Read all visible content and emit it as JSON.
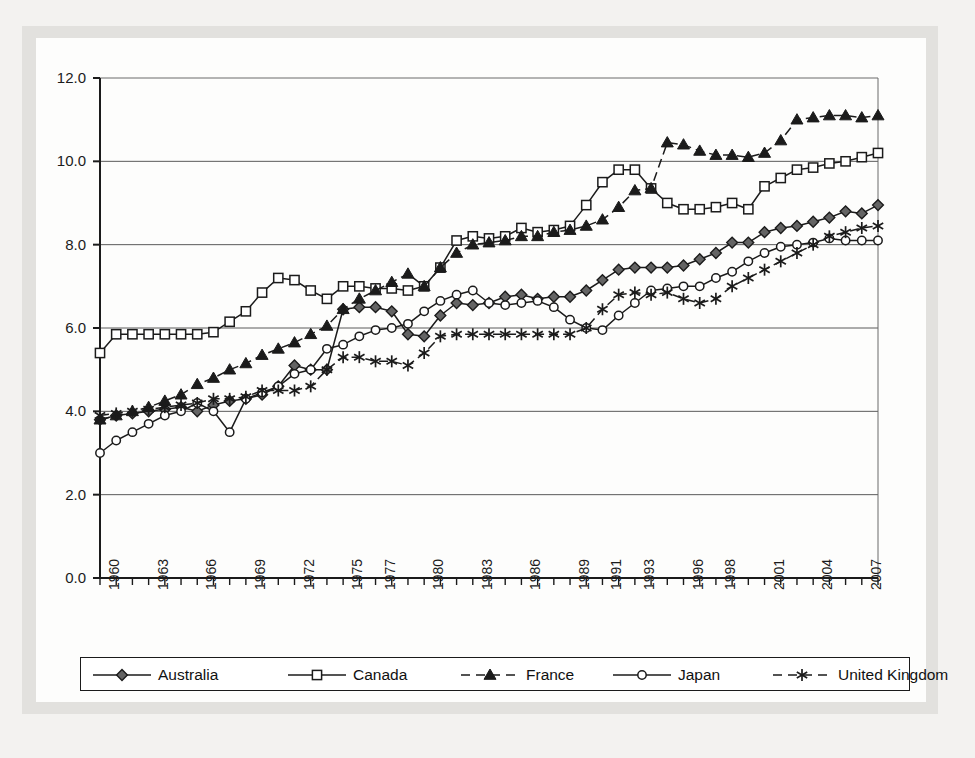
{
  "figure": {
    "background_color": "#e2e1de",
    "card_color": "#fdfdfc",
    "ink_color": "#1b1b1b"
  },
  "legend": {
    "items": [
      {
        "label": "Australia",
        "marker": "filled-diamond-marker",
        "line": "solid"
      },
      {
        "label": "Canada",
        "marker": "open-square-marker",
        "line": "solid"
      },
      {
        "label": "France",
        "marker": "filled-triangle-marker",
        "line": "dashed"
      },
      {
        "label": "Japan",
        "marker": "open-circle-marker",
        "line": "solid"
      },
      {
        "label": "United Kingdom",
        "marker": "asterisk-marker",
        "line": "dashed"
      }
    ]
  },
  "chart_data": {
    "type": "line",
    "title": "",
    "subtitle": "",
    "xlabel": "",
    "ylabel": "",
    "grid": true,
    "legend_position": "bottom",
    "ylim": [
      0.0,
      12.0
    ],
    "ytick_labels": [
      "0.0",
      "2.0",
      "4.0",
      "6.0",
      "8.0",
      "10.0",
      "12.0"
    ],
    "ytick_values": [
      0.0,
      2.0,
      4.0,
      6.0,
      8.0,
      10.0,
      12.0
    ],
    "xlim": [
      1960,
      2008
    ],
    "xtick_labels": [
      "1960",
      "1963",
      "1966",
      "1969",
      "1972",
      "1975",
      "1977",
      "1980",
      "1983",
      "1986",
      "1989",
      "1991",
      "1993",
      "1996",
      "1998",
      "2001",
      "2004",
      "2007"
    ],
    "xtick_values": [
      1960,
      1963,
      1966,
      1969,
      1972,
      1975,
      1977,
      1980,
      1983,
      1986,
      1989,
      1991,
      1993,
      1996,
      1998,
      2001,
      2004,
      2007
    ],
    "x": [
      1960,
      1961,
      1962,
      1963,
      1964,
      1965,
      1966,
      1967,
      1968,
      1969,
      1970,
      1971,
      1972,
      1973,
      1974,
      1975,
      1976,
      1977,
      1978,
      1979,
      1980,
      1981,
      1982,
      1983,
      1984,
      1985,
      1986,
      1987,
      1988,
      1989,
      1990,
      1991,
      1992,
      1993,
      1994,
      1995,
      1996,
      1997,
      1998,
      1999,
      2000,
      2001,
      2002,
      2003,
      2004,
      2005,
      2006,
      2007,
      2008
    ],
    "series": [
      {
        "name": "Australia",
        "marker": "filled-diamond-marker",
        "line": "solid",
        "values": [
          3.8,
          3.9,
          3.95,
          4.0,
          4.05,
          4.1,
          4.0,
          4.15,
          4.25,
          4.3,
          4.4,
          4.6,
          5.1,
          5.0,
          5.0,
          6.45,
          6.5,
          6.5,
          6.4,
          5.85,
          5.8,
          6.3,
          6.6,
          6.55,
          6.6,
          6.75,
          6.8,
          6.7,
          6.75,
          6.75,
          6.9,
          7.15,
          7.4,
          7.45,
          7.45,
          7.45,
          7.5,
          7.65,
          7.8,
          8.05,
          8.05,
          8.3,
          8.4,
          8.45,
          8.55,
          8.65,
          8.8,
          8.75,
          8.95
        ]
      },
      {
        "name": "Canada",
        "marker": "open-square-marker",
        "line": "solid",
        "values": [
          5.4,
          5.85,
          5.85,
          5.85,
          5.85,
          5.85,
          5.85,
          5.9,
          6.15,
          6.4,
          6.85,
          7.2,
          7.15,
          6.9,
          6.7,
          7.0,
          7.0,
          6.95,
          6.95,
          6.9,
          7.0,
          7.45,
          8.1,
          8.2,
          8.15,
          8.2,
          8.4,
          8.3,
          8.35,
          8.45,
          8.95,
          9.5,
          9.8,
          9.8,
          9.35,
          9.0,
          8.85,
          8.85,
          8.9,
          9.0,
          8.85,
          9.4,
          9.6,
          9.8,
          9.85,
          9.95,
          10.0,
          10.1,
          10.2
        ]
      },
      {
        "name": "France",
        "marker": "filled-triangle-marker",
        "line": "dashed",
        "values": [
          3.8,
          3.9,
          4.0,
          4.1,
          4.25,
          4.4,
          4.65,
          4.8,
          5.0,
          5.15,
          5.35,
          5.5,
          5.65,
          5.85,
          6.05,
          6.45,
          6.7,
          6.9,
          7.1,
          7.3,
          7.0,
          7.45,
          7.8,
          8.0,
          8.05,
          8.1,
          8.2,
          8.2,
          8.3,
          8.35,
          8.45,
          8.6,
          8.9,
          9.3,
          9.35,
          10.45,
          10.4,
          10.25,
          10.15,
          10.15,
          10.1,
          10.2,
          10.5,
          11.0,
          11.05,
          11.1,
          11.1,
          11.05,
          11.1
        ]
      },
      {
        "name": "Japan",
        "marker": "open-circle-marker",
        "line": "solid",
        "values": [
          3.0,
          3.3,
          3.5,
          3.7,
          3.9,
          4.0,
          4.2,
          4.0,
          3.5,
          4.3,
          4.45,
          4.6,
          4.9,
          5.0,
          5.5,
          5.6,
          5.8,
          5.95,
          6.0,
          6.1,
          6.4,
          6.65,
          6.8,
          6.9,
          6.6,
          6.55,
          6.6,
          6.65,
          6.5,
          6.2,
          6.0,
          5.95,
          6.3,
          6.6,
          6.9,
          6.95,
          7.0,
          7.0,
          7.2,
          7.35,
          7.6,
          7.8,
          7.95,
          8.0,
          8.05,
          8.15,
          8.1,
          8.1,
          8.1
        ]
      },
      {
        "name": "United Kingdom",
        "marker": "asterisk-marker",
        "line": "dashed",
        "values": [
          3.9,
          3.95,
          4.0,
          4.05,
          4.1,
          4.15,
          4.2,
          4.3,
          4.3,
          4.35,
          4.5,
          4.5,
          4.5,
          4.6,
          5.0,
          5.3,
          5.3,
          5.2,
          5.2,
          5.1,
          5.4,
          5.8,
          5.85,
          5.85,
          5.85,
          5.85,
          5.85,
          5.85,
          5.85,
          5.85,
          6.0,
          6.45,
          6.8,
          6.85,
          6.8,
          6.85,
          6.7,
          6.6,
          6.7,
          7.0,
          7.2,
          7.4,
          7.6,
          7.8,
          8.0,
          8.2,
          8.3,
          8.4,
          8.45
        ]
      }
    ]
  }
}
